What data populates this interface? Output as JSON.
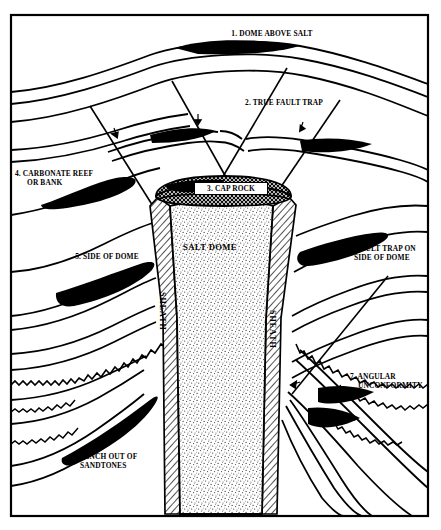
{
  "figure": {
    "title_internal": "SALT DOME",
    "frame_color": "#000000",
    "background_color": "#ffffff",
    "fill_color": "#000000",
    "width": 441,
    "height": 530
  },
  "callouts": [
    {
      "id": 1,
      "text": "1. DOME ABOVE SALT",
      "align": "center"
    },
    {
      "id": 2,
      "text": "2. TRUE FAULT TRAP",
      "align": "center"
    },
    {
      "id": 3,
      "text": "3. CAP ROCK",
      "align": "center",
      "boxed": true
    },
    {
      "id": 4,
      "text": "4. CARBONATE REEF\n      OR BANK",
      "align": "left"
    },
    {
      "id": 5,
      "text": "5. SIDE OF DOME",
      "align": "center"
    },
    {
      "id": 6,
      "text": "6. FAULT TRAP ON\n   SIDE OF DOME",
      "align": "left"
    },
    {
      "id": 7,
      "text": "7. ANGULAR\n    UNCONFORMITY",
      "align": "left"
    },
    {
      "id": 8,
      "text": "8. PINCH OUT OF\n   SANDTONES",
      "align": "left"
    }
  ],
  "interior_labels": {
    "salt_dome": "SALT DOME",
    "sheath_left": "SHEATH",
    "sheath_right": "SHEATH"
  },
  "legend_meaning": {
    "black_fill": "hydrocarbon accumulation",
    "stipple_fill": "salt",
    "crosshatch_fill": "cap rock",
    "diagonal_hatch_fill": "sheath",
    "zigzag_line": "angular unconformity surface"
  }
}
